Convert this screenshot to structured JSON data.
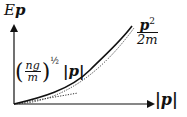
{
  "diagram": {
    "type": "dispersion-relation",
    "y_axis_label": {
      "base": "E",
      "subscript": "p"
    },
    "x_axis_label": "|p|",
    "curves": [
      {
        "name": "bogoliubov-dispersion",
        "style": "solid"
      },
      {
        "name": "free-particle",
        "style": "dotted",
        "label": {
          "numerator": "p²",
          "denominator": "2m"
        }
      },
      {
        "name": "phonon-linear",
        "style": "dotted",
        "label": {
          "numerator": "ng",
          "denominator": "m",
          "exponent": "1/2",
          "suffix": "|p|"
        }
      }
    ],
    "labels": {
      "ylabel_E": "E",
      "ylabel_p": "p",
      "xlabel": "|p|",
      "p_squared_num": "p",
      "p_squared_exp": "2",
      "p_squared_den": "2m",
      "linear_num": "ng",
      "linear_den": "m",
      "linear_exp": "½",
      "linear_suffix": "|p|",
      "lparen": "(",
      "rparen": ")"
    },
    "colors": {
      "ink": "#111111",
      "background": "#ffffff"
    }
  }
}
